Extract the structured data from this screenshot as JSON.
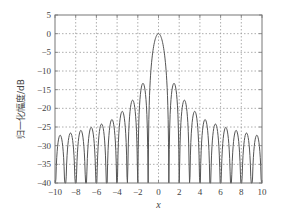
{
  "chart_data": {
    "type": "line",
    "title": "",
    "xlabel": "x",
    "ylabel": "归一化幅度/dB",
    "xlim": [
      -10,
      10
    ],
    "ylim": [
      -40,
      5
    ],
    "xticks": [
      -10,
      -8,
      -6,
      -4,
      -2,
      0,
      2,
      4,
      6,
      8,
      10
    ],
    "yticks": [
      5,
      0,
      -5,
      -10,
      -15,
      -20,
      -25,
      -30,
      -35,
      -40
    ],
    "xtick_labels": [
      "−10",
      "−8",
      "−6",
      "−4",
      "−2",
      "0",
      "2",
      "4",
      "6",
      "8",
      "10"
    ],
    "ytick_labels": [
      "5",
      "0",
      "−5",
      "−10",
      "−15",
      "−20",
      "−25",
      "−30",
      "−35",
      "−40"
    ],
    "grid": true,
    "grid_style": "dotted",
    "legend": null,
    "series": [
      {
        "name": "normalized amplitude",
        "description": "sinc-type pattern in dB, main lobe peak 0 dB at x=0, nulls at nonzero integers clipped to -40 dB",
        "main_lobe_peak": {
          "x": 0,
          "y": 0
        },
        "nulls_x": [
          -10,
          -9,
          -8,
          -7,
          -6,
          -5,
          -4,
          -3,
          -2,
          -1,
          1,
          2,
          3,
          4,
          5,
          6,
          7,
          8,
          9,
          10
        ],
        "sidelobe_peaks": [
          {
            "x": -9.5,
            "y": -27.2
          },
          {
            "x": -8.5,
            "y": -26.6
          },
          {
            "x": -7.5,
            "y": -25.9
          },
          {
            "x": -6.5,
            "y": -25.1
          },
          {
            "x": -5.5,
            "y": -24.2
          },
          {
            "x": -4.5,
            "y": -23.0
          },
          {
            "x": -3.47,
            "y": -20.8
          },
          {
            "x": -2.46,
            "y": -17.8
          },
          {
            "x": -1.43,
            "y": -13.3
          },
          {
            "x": 1.43,
            "y": -13.3
          },
          {
            "x": 2.46,
            "y": -17.8
          },
          {
            "x": 3.47,
            "y": -20.8
          },
          {
            "x": 4.5,
            "y": -23.0
          },
          {
            "x": 5.5,
            "y": -24.2
          },
          {
            "x": 6.5,
            "y": -25.1
          },
          {
            "x": 7.5,
            "y": -25.9
          },
          {
            "x": 8.5,
            "y": -26.6
          },
          {
            "x": 9.5,
            "y": -27.2
          }
        ],
        "color": "#555555"
      }
    ]
  },
  "colors": {
    "line": "#555555",
    "axes": "#777777",
    "grid": "#999999"
  }
}
